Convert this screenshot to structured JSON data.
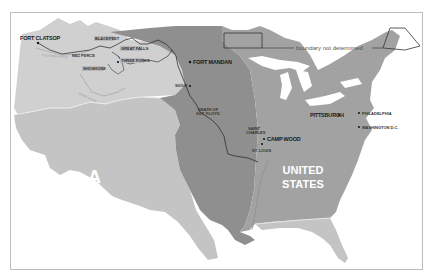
{
  "map": {
    "colors": {
      "background": "#ffffff",
      "frame": "#bdbdbd",
      "western_territory": "#c4c4c4",
      "louisiana_purchase": "#8f8f8f",
      "united_states": "#a2a2a2",
      "oregon_country": "#d0d0d0",
      "route": "#222222",
      "region_label": "#ffffff"
    },
    "region_labels": {
      "west": "A",
      "us_line1": "UNITED",
      "us_line2": "STATES"
    },
    "places": [
      {
        "name": "FORT CLATSOP"
      },
      {
        "name": "BLACKFEET"
      },
      {
        "name": "GREAT FALLS"
      },
      {
        "name": "THREE FORKS"
      },
      {
        "name": "NEZ PERCE"
      },
      {
        "name": "SHOSHONE"
      },
      {
        "name": "FORT MANDAN"
      },
      {
        "name": "SIOUX"
      },
      {
        "name": "DEATH OF",
        "line2": "SGT. FLOYD"
      },
      {
        "name": "SAINT",
        "line2": "CHARLES"
      },
      {
        "name": "CAMP WOOD"
      },
      {
        "name": "ST. LOUIS"
      },
      {
        "name": "PITTSBURGH"
      },
      {
        "name": "PHILADELPHIA"
      },
      {
        "name": "WASHINGTON D.C."
      }
    ],
    "rivers": [
      {
        "name": "COLUMBIA RIVER"
      },
      {
        "name": "SNAKE RIVER"
      }
    ],
    "annotation": "boundary not determined"
  }
}
